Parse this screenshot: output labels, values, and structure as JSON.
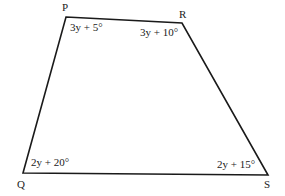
{
  "figure": {
    "type": "quadrilateral",
    "vertices": [
      {
        "name": "P",
        "x": 66,
        "y": 17,
        "label_x": 62,
        "label_y": 11,
        "angle_label": "3y + 5°",
        "angle_x": 70,
        "angle_y": 31
      },
      {
        "name": "R",
        "x": 182,
        "y": 23,
        "label_x": 179,
        "label_y": 18,
        "angle_label": "3y + 10°",
        "angle_x": 140,
        "angle_y": 36
      },
      {
        "name": "S",
        "x": 268,
        "y": 175,
        "label_x": 264,
        "label_y": 188,
        "angle_label": "2y + 15°",
        "angle_x": 217,
        "angle_y": 168
      },
      {
        "name": "Q",
        "x": 23,
        "y": 173,
        "label_x": 17,
        "label_y": 188,
        "angle_label": "2y + 20°",
        "angle_x": 31,
        "angle_y": 166
      }
    ],
    "stroke_color": "#1a1a1a"
  }
}
